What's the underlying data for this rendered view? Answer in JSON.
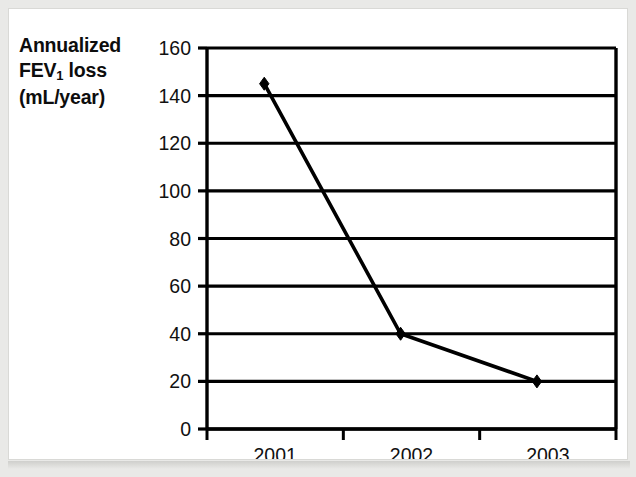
{
  "figure": {
    "axis_caption_lines": [
      "Annualized",
      "FEV1 loss",
      "(mL/year)"
    ],
    "caption_line1": "Annualized",
    "caption_line2_pre": "FEV",
    "caption_line2_sub": "1",
    "caption_line2_post": " loss",
    "caption_line3": "(mL/year)",
    "line_color": "#000000",
    "marker_color": "#000000",
    "grid_color": "#000000",
    "background": "#ffffff",
    "frame_color": "#d9d9d6"
  },
  "chart_data": {
    "type": "line",
    "title": "",
    "xlabel": "",
    "ylabel": "Annualized FEV1 loss (mL/year)",
    "categories": [
      "2001",
      "2002",
      "2003"
    ],
    "values": [
      145,
      40,
      20
    ],
    "series": [
      {
        "name": "Annualized FEV1 loss",
        "values": [
          145,
          40,
          20
        ],
        "marker": "diamond",
        "color": "#000000"
      }
    ],
    "ylim": [
      0,
      160
    ],
    "ytick_labels": [
      "0",
      "20",
      "40",
      "60",
      "80",
      "100",
      "120",
      "140",
      "160"
    ],
    "ytick_values": [
      0,
      20,
      40,
      60,
      80,
      100,
      120,
      140,
      160
    ],
    "xtick_labels": [
      "2001",
      "2002",
      "2003"
    ],
    "grid": "horizontal",
    "legend": "none"
  }
}
